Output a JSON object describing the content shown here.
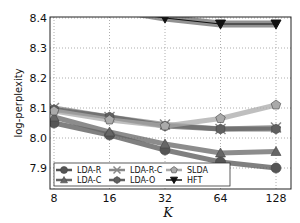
{
  "chart_data": {
    "type": "line",
    "title": "",
    "xlabel": "K",
    "ylabel": "log-perplexity",
    "x": [
      8,
      16,
      32,
      64,
      128
    ],
    "x_tick_labels": [
      "8",
      "16",
      "32",
      "64",
      "128"
    ],
    "x_scale": "log2",
    "y_tick_labels": [
      "7.9",
      "8.0",
      "8.1",
      "8.2",
      "8.3",
      "8.4"
    ],
    "ylim": [
      7.86,
      8.405
    ],
    "grid": true,
    "legend_position": "lower left",
    "series": [
      {
        "name": "LDA-R",
        "marker": "circle",
        "color": "#555555",
        "values": [
          8.05,
          8.01,
          7.96,
          7.92,
          7.9
        ]
      },
      {
        "name": "LDA-C",
        "marker": "triangle-up",
        "color": "#666666",
        "values": [
          8.07,
          8.02,
          7.98,
          7.95,
          7.955
        ]
      },
      {
        "name": "LDA-R-C",
        "marker": "x-star",
        "color": "#888888",
        "values": [
          8.1,
          8.07,
          8.045,
          8.03,
          8.035
        ]
      },
      {
        "name": "LDA-O",
        "marker": "hexagon",
        "color": "#606060",
        "values": [
          8.095,
          8.07,
          8.04,
          8.03,
          8.03
        ]
      },
      {
        "name": "SLDA",
        "marker": "pentagon",
        "color": "#aaaaaa",
        "values": [
          8.09,
          8.06,
          8.04,
          8.065,
          8.11
        ]
      },
      {
        "name": "HFT",
        "marker": "triangle-down",
        "color": "#111111",
        "values": [
          8.47,
          8.43,
          8.4,
          8.38,
          8.38
        ]
      }
    ]
  }
}
